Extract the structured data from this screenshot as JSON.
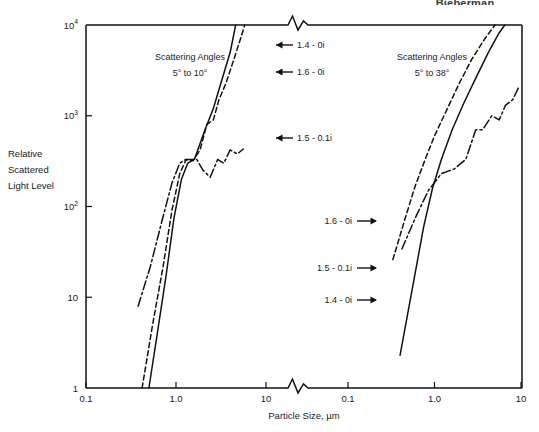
{
  "header": {
    "title": "Bieberman"
  },
  "chart_data": {
    "type": "line",
    "title": "",
    "xlabel": "Particle Size, µm",
    "ylabel": "Relative Scattered Light Level",
    "ylabel_lines": [
      "Relative",
      "Scattered",
      "Light Level"
    ],
    "ylim": [
      1,
      10000
    ],
    "y_ticks": [
      "1",
      "10",
      "10",
      "10",
      "10"
    ],
    "y_tick_values": [
      1,
      10,
      100,
      1000,
      10000
    ],
    "y_tick_labels": [
      "1",
      "10",
      "10²",
      "10³",
      "10⁴"
    ],
    "y_tick_mantissa": [
      "1",
      "10",
      "10",
      "10",
      "10"
    ],
    "y_tick_exponent": [
      "",
      "",
      "2",
      "3",
      "4"
    ],
    "grid": false,
    "legend_position": "inline-annotations",
    "axis_break": true,
    "panels": [
      {
        "id": "left",
        "annotation_title_lines": [
          "Scattering Angles",
          "5° to 10°"
        ],
        "scattering_angles": "5° to 10°",
        "xlim": [
          0.1,
          10
        ],
        "x_ticks": [
          "0.1",
          "1.0",
          "10"
        ],
        "x_tick_values": [
          0.1,
          1.0,
          10
        ],
        "series": [
          {
            "name": "1.4 - 0i",
            "style": "solid",
            "label_arrow": "left",
            "points": [
              [
                0.5,
                1.0
              ],
              [
                0.62,
                4.0
              ],
              [
                0.78,
                18
              ],
              [
                0.95,
                75
              ],
              [
                1.15,
                200
              ],
              [
                1.35,
                300
              ],
              [
                1.6,
                330
              ],
              [
                2.1,
                700
              ],
              [
                2.6,
                1200
              ],
              [
                3.2,
                2400
              ],
              [
                4.0,
                5000
              ],
              [
                4.6,
                10000
              ]
            ]
          },
          {
            "name": "1.6 - 0i",
            "style": "dashed",
            "label_arrow": "left",
            "points": [
              [
                0.42,
                1.0
              ],
              [
                0.55,
                5.0
              ],
              [
                0.72,
                22
              ],
              [
                0.9,
                90
              ],
              [
                1.1,
                230
              ],
              [
                1.3,
                330
              ],
              [
                1.55,
                320
              ],
              [
                1.85,
                420
              ],
              [
                2.2,
                800
              ],
              [
                2.6,
                900
              ],
              [
                3.0,
                1500
              ],
              [
                3.6,
                2300
              ],
              [
                4.4,
                4200
              ],
              [
                5.2,
                7000
              ],
              [
                5.8,
                10000
              ]
            ]
          },
          {
            "name": "1.5 - 0.1i",
            "style": "dashdot",
            "label_arrow": "left",
            "points": [
              [
                0.38,
                8.0
              ],
              [
                0.52,
                22
              ],
              [
                0.7,
                70
              ],
              [
                0.9,
                180
              ],
              [
                1.1,
                300
              ],
              [
                1.28,
                330
              ],
              [
                1.7,
                330
              ],
              [
                2.0,
                250
              ],
              [
                2.4,
                210
              ],
              [
                2.9,
                330
              ],
              [
                3.4,
                300
              ],
              [
                4.0,
                420
              ],
              [
                4.8,
                380
              ],
              [
                5.6,
                430
              ]
            ]
          }
        ]
      },
      {
        "id": "right",
        "annotation_title_lines": [
          "Scattering Angles",
          "5° to 38°"
        ],
        "scattering_angles": "5° to 38°",
        "xlim": [
          0.1,
          10
        ],
        "x_ticks": [
          "0.1",
          "1.0",
          "10"
        ],
        "x_tick_values": [
          0.1,
          1.0,
          10
        ],
        "series": [
          {
            "name": "1.4 - 0i",
            "style": "solid",
            "label_arrow": "right",
            "points": [
              [
                0.4,
                2.3
              ],
              [
                0.55,
                12
              ],
              [
                0.75,
                60
              ],
              [
                0.95,
                160
              ],
              [
                1.2,
                330
              ],
              [
                1.6,
                700
              ],
              [
                2.2,
                1400
              ],
              [
                3.0,
                2600
              ],
              [
                4.2,
                5000
              ],
              [
                5.5,
                8000
              ],
              [
                6.5,
                10000
              ]
            ]
          },
          {
            "name": "1.6 - 0i",
            "style": "dashed",
            "label_arrow": "right",
            "points": [
              [
                0.33,
                26
              ],
              [
                0.45,
                70
              ],
              [
                0.6,
                170
              ],
              [
                0.78,
                330
              ],
              [
                1.0,
                600
              ],
              [
                1.35,
                1100
              ],
              [
                1.9,
                2200
              ],
              [
                2.7,
                4200
              ],
              [
                3.8,
                7000
              ],
              [
                5.0,
                10000
              ]
            ]
          },
          {
            "name": "1.5 - 0.1i",
            "style": "dashdot",
            "label_arrow": "right",
            "points": [
              [
                0.42,
                34
              ],
              [
                0.6,
                75
              ],
              [
                0.85,
                150
              ],
              [
                1.2,
                230
              ],
              [
                1.7,
                260
              ],
              [
                2.3,
                330
              ],
              [
                3.0,
                700
              ],
              [
                3.6,
                700
              ],
              [
                4.6,
                1000
              ],
              [
                5.6,
                900
              ],
              [
                6.6,
                1300
              ],
              [
                8.0,
                1500
              ],
              [
                9.5,
                2100
              ]
            ]
          }
        ]
      }
    ],
    "annotations": [
      {
        "panel": "left",
        "text": "1.4 - 0i",
        "arrow": "left",
        "x": 276,
        "y": 45
      },
      {
        "panel": "left",
        "text": "1.6 - 0i",
        "arrow": "left",
        "x": 276,
        "y": 72
      },
      {
        "panel": "left",
        "text": "1.5 - 0.1i",
        "arrow": "left",
        "x": 276,
        "y": 138
      },
      {
        "panel": "right",
        "text": "1.6 - 0i",
        "arrow": "right",
        "x": 352,
        "y": 221
      },
      {
        "panel": "right",
        "text": "1.5 - 0.1i",
        "arrow": "right",
        "x": 352,
        "y": 268
      },
      {
        "panel": "right",
        "text": "1.4 - 0i",
        "arrow": "right",
        "x": 352,
        "y": 300
      }
    ]
  }
}
